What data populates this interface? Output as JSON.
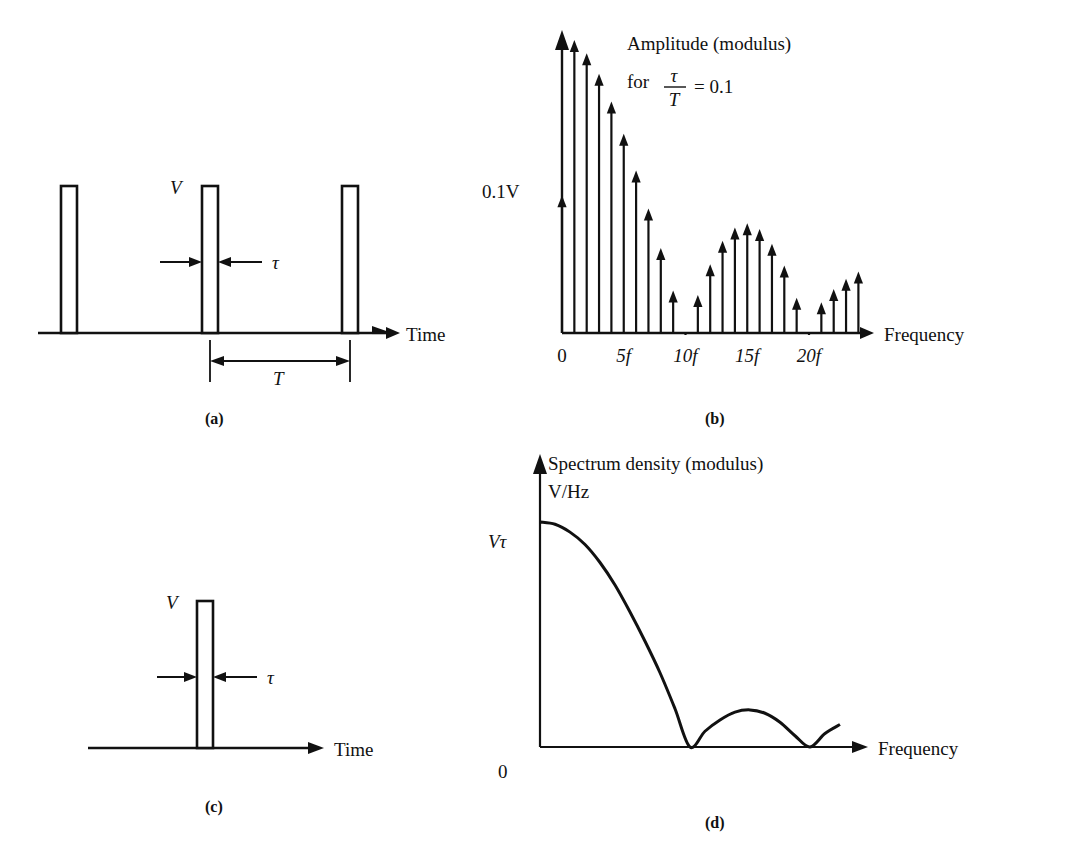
{
  "figure": {
    "panels": [
      {
        "id": "a",
        "caption": "(a)",
        "type": "time-domain-pulse-train",
        "axis_label": "Time",
        "amplitude_label": "V",
        "width_label": "τ",
        "period_label": "T",
        "pulse_count": 3,
        "description": "Periodic rectangular pulse train of amplitude V, pulse width τ and period T"
      },
      {
        "id": "b",
        "caption": "(b)",
        "type": "line-spectrum",
        "title_line1": "Amplitude (modulus)",
        "title_line2_prefix": "for",
        "title_numerator": "τ",
        "title_denominator": "T",
        "title_equals": "= 0.1",
        "y_axis_label": "0.1V",
        "x_axis_label": "Frequency",
        "tick_labels": [
          "0",
          "5f",
          "10f",
          "15f",
          "20f"
        ],
        "tick_values": [
          0,
          5,
          10,
          15,
          20
        ]
      },
      {
        "id": "c",
        "caption": "(c)",
        "type": "time-domain-single-pulse",
        "axis_label": "Time",
        "amplitude_label": "V",
        "width_label": "τ",
        "pulse_count": 1,
        "description": "Single isolated rectangular pulse of amplitude V and width τ"
      },
      {
        "id": "d",
        "caption": "(d)",
        "type": "continuous-spectrum",
        "title_line1": "Spectrum density (modulus)",
        "title_line2": "V/Hz",
        "y_axis_label": "Vτ",
        "origin_label": "0",
        "x_axis_label": "Frequency"
      }
    ]
  },
  "chart_data": [
    {
      "type": "line",
      "panel": "b",
      "title": "Amplitude (modulus) for τ/T = 0.1",
      "xlabel": "Frequency",
      "ylabel": "0.1V",
      "grid": false,
      "legend": "none",
      "xlim": [
        0,
        24
      ],
      "ylim": [
        0,
        1.0
      ],
      "note": "Line spectrum of a periodic pulse train; harmonic amplitudes follow |sinc(nτ/T)| envelope with nulls at every 10th harmonic",
      "x": [
        0,
        1,
        2,
        3,
        4,
        5,
        6,
        7,
        8,
        9,
        10,
        11,
        12,
        13,
        14,
        15,
        16,
        17,
        18,
        19,
        20,
        21,
        22,
        23,
        24
      ],
      "values": [
        0.47,
        1.0,
        0.955,
        0.885,
        0.79,
        0.68,
        0.555,
        0.425,
        0.29,
        0.145,
        0.0,
        0.13,
        0.235,
        0.315,
        0.36,
        0.375,
        0.355,
        0.305,
        0.23,
        0.12,
        0.0,
        0.105,
        0.15,
        0.185,
        0.21
      ]
    },
    {
      "type": "line",
      "panel": "d",
      "title": "Spectrum density (modulus) V/Hz",
      "xlabel": "Frequency",
      "ylabel": "Vτ",
      "grid": false,
      "legend": "none",
      "xlim": [
        0,
        1.0
      ],
      "ylim": [
        0,
        1.0
      ],
      "note": "Continuous sinc envelope of a single pulse, peak Vτ at zero frequency with nulls and decaying side lobes",
      "x": [
        0.0,
        0.05,
        0.1,
        0.15,
        0.2,
        0.25,
        0.3,
        0.35,
        0.4,
        0.45,
        0.5,
        0.55,
        0.6,
        0.65,
        0.7,
        0.75,
        0.8,
        0.85,
        0.9,
        0.95,
        1.0
      ],
      "values": [
        1.0,
        0.99,
        0.955,
        0.9,
        0.82,
        0.72,
        0.6,
        0.47,
        0.33,
        0.17,
        0.0,
        0.07,
        0.12,
        0.155,
        0.165,
        0.15,
        0.11,
        0.05,
        0.0,
        0.06,
        0.1
      ]
    }
  ]
}
